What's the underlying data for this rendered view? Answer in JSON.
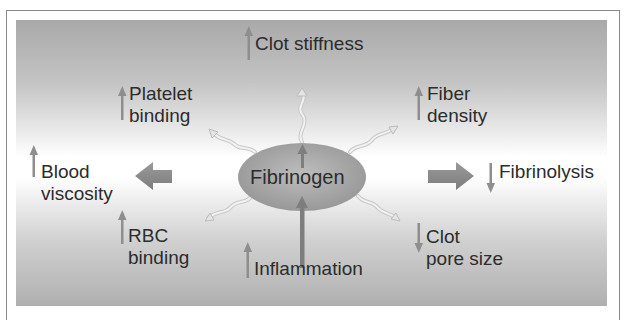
{
  "diagram": {
    "center": {
      "label": "Fibrinogen"
    },
    "effects": [
      {
        "id": "clot-stiffness",
        "line1": "Clot stiffness",
        "line2": "",
        "direction": "up"
      },
      {
        "id": "platelet-binding",
        "line1": "Platelet",
        "line2": "binding",
        "direction": "up"
      },
      {
        "id": "fiber-density",
        "line1": "Fiber",
        "line2": "density",
        "direction": "up"
      },
      {
        "id": "blood-viscosity",
        "line1": "Blood",
        "line2": "viscosity",
        "direction": "up"
      },
      {
        "id": "fibrinolysis",
        "line1": "Fibrinolysis",
        "line2": "",
        "direction": "down"
      },
      {
        "id": "rbc-binding",
        "line1": "RBC",
        "line2": "binding",
        "direction": "up"
      },
      {
        "id": "clot-pore-size",
        "line1": "Clot",
        "line2": "pore size",
        "direction": "down"
      },
      {
        "id": "inflammation",
        "line1": "Inflammation",
        "line2": "",
        "direction": "up"
      }
    ],
    "colors": {
      "arrow": "#8a8a8a",
      "text": "#2c2c2c",
      "ellipse": "#9e9e9e",
      "border": "#8a8a8a"
    }
  }
}
